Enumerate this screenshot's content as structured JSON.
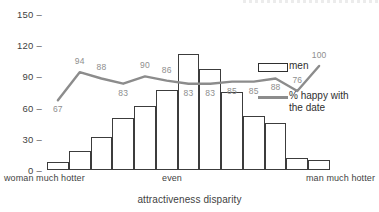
{
  "chart_data": {
    "type": "bar",
    "title": "",
    "xlabel": "attractiveness disparity",
    "ylabel": "",
    "ylim": [
      0,
      150
    ],
    "yticks": [
      0,
      30,
      60,
      90,
      120,
      150
    ],
    "grid": false,
    "legend_position": "right",
    "categories": [
      "1",
      "2",
      "3",
      "4",
      "5",
      "6",
      "7",
      "8",
      "9",
      "10",
      "11",
      "12",
      "13"
    ],
    "category_labels": {
      "left": "woman much hotter",
      "middle": "even",
      "right": "man much hotter"
    },
    "series": [
      {
        "name": "men",
        "type": "bar",
        "color": "#ffffff",
        "edge_color": "#3c3c3c",
        "values": [
          8,
          18,
          32,
          50,
          62,
          77,
          112,
          97,
          75,
          52,
          45,
          12,
          10
        ]
      },
      {
        "name": "% happy with the date",
        "type": "line",
        "color": "#8c8c8c",
        "values": [
          67,
          94,
          88,
          83,
          90,
          86,
          83,
          83,
          85,
          85,
          88,
          76,
          100
        ],
        "label_positions": [
          "below",
          "above",
          "above",
          "below",
          "above",
          "above",
          "below",
          "below",
          "below",
          "below",
          "below",
          "above",
          "above"
        ]
      }
    ]
  },
  "axis": {
    "y_ticks": [
      "150",
      "120",
      "90",
      "60",
      "30",
      "0"
    ],
    "tick_dash": "–",
    "x_title": "attractiveness disparity",
    "x_left_label": "woman much hotter",
    "x_mid_label": "even",
    "x_right_label": "man much hotter"
  },
  "legend": {
    "items": [
      {
        "label": "men",
        "swatch": "bar-swatch"
      },
      {
        "label": "% happy with\nthe date",
        "line1": "% happy with",
        "line2": "the date",
        "swatch": "line-swatch"
      }
    ]
  }
}
